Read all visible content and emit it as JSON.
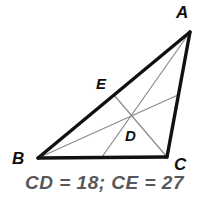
{
  "figure": {
    "name": "triangle-medians-centroid",
    "background_color": "#ffffff",
    "outline_color": "#111111",
    "cevian_color": "#8a8a8a",
    "label_color": "#111111",
    "vertices": {
      "A": {
        "label": "A",
        "x": 190,
        "y": 32,
        "label_x": 176,
        "label_y": 18
      },
      "B": {
        "label": "B",
        "x": 38,
        "y": 158,
        "label_x": 12,
        "label_y": 164
      },
      "C": {
        "label": "C",
        "x": 167,
        "y": 157,
        "label_x": 174,
        "label_y": 170
      }
    },
    "points": {
      "D": {
        "label": "D",
        "x": 133,
        "y": 115,
        "label_x": 125,
        "label_y": 141
      },
      "E": {
        "label": "E",
        "x": 114,
        "y": 95,
        "label_x": 96,
        "label_y": 89
      },
      "M_BC": {
        "x": 102,
        "y": 157
      },
      "M_AC": {
        "x": 178,
        "y": 95
      }
    },
    "sides": [
      {
        "name": "side-AB",
        "from": "A",
        "to": "B"
      },
      {
        "name": "side-BC",
        "from": "B",
        "to": "C"
      },
      {
        "name": "side-CA",
        "from": "C",
        "to": "A"
      }
    ],
    "cevians": [
      {
        "name": "median-A-to-BC",
        "from": "A",
        "to": "M_BC"
      },
      {
        "name": "median-B-to-AC",
        "from": "B",
        "to": "M_AC"
      },
      {
        "name": "median-C-to-E",
        "from": "C",
        "to": "E"
      }
    ]
  },
  "caption": {
    "text": "CD = 18; CE = 27",
    "color": "#58585a"
  }
}
